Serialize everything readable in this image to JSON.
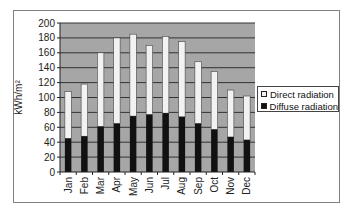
{
  "chart_data": {
    "type": "bar",
    "stacked": true,
    "title": "",
    "xlabel": "",
    "ylabel": "kWh/m²",
    "ylim": [
      0,
      200
    ],
    "yticks": [
      0,
      20,
      40,
      60,
      80,
      100,
      120,
      140,
      160,
      180,
      200
    ],
    "grid": true,
    "legend_position": "right",
    "categories": [
      "Jan",
      "Feb",
      "Mar",
      "Apr",
      "May",
      "Jun",
      "Jul",
      "Aug",
      "Sep",
      "Oct",
      "Nov",
      "Dec"
    ],
    "series": [
      {
        "name": "Diffuse radiation",
        "color": "#111111",
        "values": [
          45,
          48,
          61,
          65,
          75,
          77,
          79,
          74,
          65,
          57,
          47,
          43
        ]
      },
      {
        "name": "Direct radiation",
        "color": "#f2f2f2",
        "values": [
          63,
          70,
          99,
          115,
          110,
          93,
          103,
          101,
          83,
          78,
          63,
          59
        ]
      }
    ],
    "totals": [
      108,
      118,
      160,
      180,
      185,
      170,
      182,
      175,
      148,
      135,
      110,
      102
    ]
  },
  "legend": {
    "items": [
      {
        "label": "Direct radiation",
        "color": "#f2f2f2"
      },
      {
        "label": "Diffuse radiation",
        "color": "#111111"
      }
    ]
  },
  "axis": {
    "ylabel": "kWh/m²"
  },
  "colors": {
    "plot_bg": "#a6a6a6",
    "gridline": "#333333"
  }
}
